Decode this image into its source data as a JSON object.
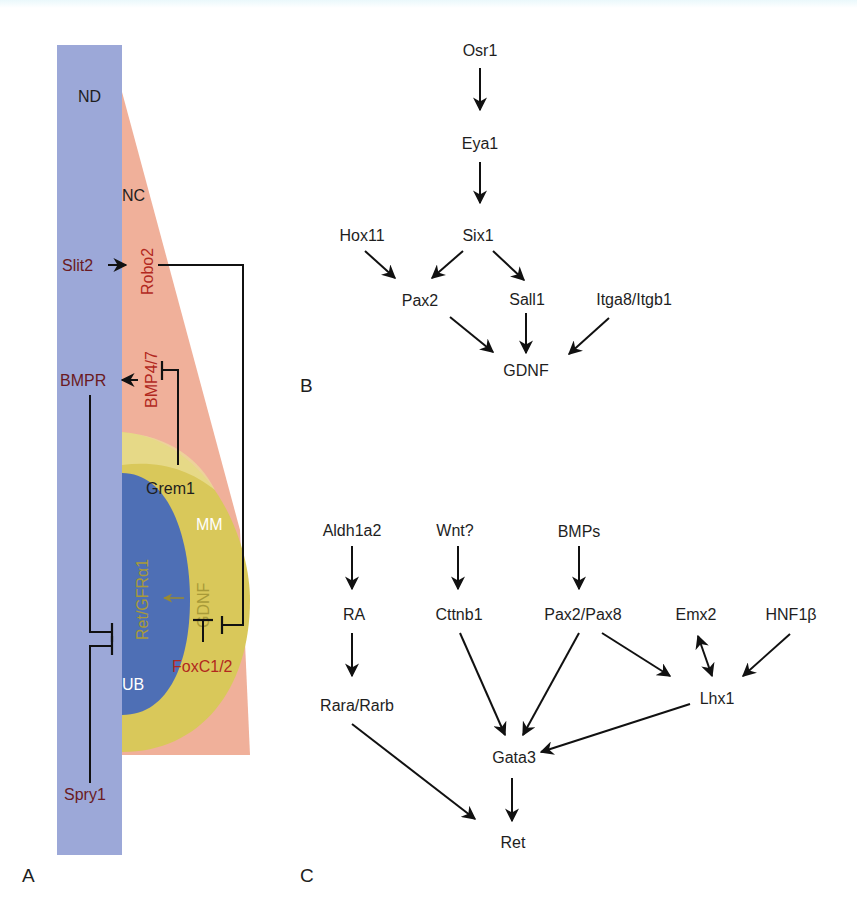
{
  "figure": {
    "panel_a": {
      "label": "A",
      "regions": {
        "nd": "ND",
        "nc": "NC",
        "mm": "MM",
        "ub": "UB"
      },
      "genes": {
        "slit2": "Slit2",
        "robo2": "Robo2",
        "bmpr": "BMPR",
        "bmp47": "BMP4/7",
        "grem1": "Grem1",
        "ret_gfra1": "Ret/GFRα1",
        "gdnf": "GDNF",
        "foxc12": "FoxC1/2",
        "spry1": "Spry1"
      },
      "colors": {
        "nd": "#9ca8d8",
        "nc": "#f0b09a",
        "mm": "#d9c85a",
        "ub": "#4e6fb5",
        "dark_red_text": "#6a1a22",
        "red_text": "#b2281e",
        "gold_text": "#a89a38"
      }
    },
    "panel_b": {
      "label": "B",
      "nodes": {
        "osr1": "Osr1",
        "eya1": "Eya1",
        "six1": "Six1",
        "hox11": "Hox11",
        "pax2": "Pax2",
        "sall1": "Sall1",
        "itga8": "Itga8/Itgb1",
        "gdnf": "GDNF"
      }
    },
    "panel_c": {
      "label": "C",
      "nodes": {
        "aldh1a2": "Aldh1a2",
        "wnt": "Wnt?",
        "bmps": "BMPs",
        "ra": "RA",
        "cttnb1": "Cttnb1",
        "pax28": "Pax2/Pax8",
        "emx2": "Emx2",
        "hnf1b": "HNF1β",
        "rara": "Rara/Rarb",
        "lhx1": "Lhx1",
        "gata3": "Gata3",
        "ret": "Ret"
      }
    }
  }
}
